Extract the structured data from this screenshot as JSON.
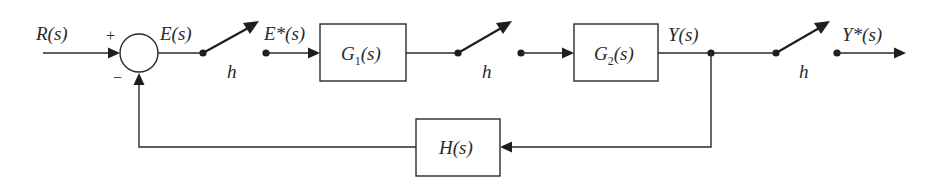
{
  "diagram": {
    "type": "sampled-data feedback control block diagram",
    "signals": {
      "input": "R(s)",
      "error": "E(s)",
      "sampled_error": "E*(s)",
      "output": "Y(s)",
      "sampled_output": "Y*(s)"
    },
    "summing_junction": {
      "plus_sign": "+",
      "minus_sign": "−"
    },
    "blocks": [
      {
        "id": "g1",
        "name": "G",
        "subscript": "1",
        "arg": "(s)"
      },
      {
        "id": "g2",
        "name": "G",
        "subscript": "2",
        "arg": "(s)"
      },
      {
        "id": "h",
        "name": "H",
        "subscript": "",
        "arg": "(s)"
      }
    ],
    "samplers": [
      {
        "id": "sampler-1",
        "label": "h"
      },
      {
        "id": "sampler-2",
        "label": "h"
      },
      {
        "id": "sampler-3",
        "label": "h"
      }
    ]
  }
}
